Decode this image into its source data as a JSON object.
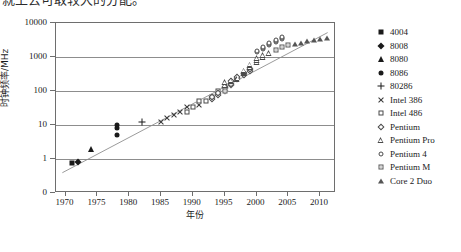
{
  "top_text": "就上去可取较大的分配。",
  "chart_data": {
    "type": "scatter",
    "title": "",
    "xlabel": "年份",
    "ylabel": "时钟频率/MHz",
    "xlim": [
      1968.5,
      2012.5
    ],
    "ylim_log": [
      0.1,
      10000
    ],
    "y_scale": "log",
    "grid": true,
    "legend_position": "right",
    "y_ticks": [
      {
        "label": "10000",
        "value": 10000
      },
      {
        "label": "1000",
        "value": 1000
      },
      {
        "label": "100",
        "value": 100
      },
      {
        "label": "10",
        "value": 10
      },
      {
        "label": "1",
        "value": 1
      },
      {
        "label": "0",
        "value": 0.1
      }
    ],
    "x_ticks": [
      {
        "label": "1970",
        "value": 1970
      },
      {
        "label": "1975",
        "value": 1975
      },
      {
        "label": "1980",
        "value": 1980
      },
      {
        "label": "1985",
        "value": 1985
      },
      {
        "label": "1990",
        "value": 1990
      },
      {
        "label": "1995",
        "value": 1995
      },
      {
        "label": "2000",
        "value": 2000
      },
      {
        "label": "2005",
        "value": 2005
      },
      {
        "label": "2010",
        "value": 2010
      }
    ],
    "trend_line": {
      "x0": 1969.5,
      "y0": 0.35,
      "x1": 2011.5,
      "y1": 5200
    },
    "series": [
      {
        "name": "4004",
        "marker": "filled-square",
        "marker_class": "m-sq-f",
        "points": [
          [
            1971,
            0.74
          ]
        ]
      },
      {
        "name": "8008",
        "marker": "filled-diamond",
        "marker_class": "m-di-f",
        "points": [
          [
            1972,
            0.8
          ]
        ]
      },
      {
        "name": "8080",
        "marker": "filled-triangle",
        "marker_class": "m-tr-f",
        "points": [
          [
            1974,
            2.0
          ]
        ]
      },
      {
        "name": "8086",
        "marker": "filled-circle",
        "marker_class": "m-ci-f",
        "points": [
          [
            1978,
            10.0
          ],
          [
            1978,
            8.0
          ],
          [
            1978,
            5.0
          ]
        ]
      },
      {
        "name": "80286",
        "marker": "plus",
        "marker_class": "m-plus",
        "points": [
          [
            1982,
            12.5
          ]
        ]
      },
      {
        "name": "Intel 386",
        "marker": "cross",
        "marker_class": "m-cross",
        "points": [
          [
            1985,
            12.0
          ],
          [
            1986,
            16.0
          ],
          [
            1987,
            20.0
          ],
          [
            1988,
            25.0
          ],
          [
            1989,
            33.0
          ],
          [
            1991,
            40.0
          ]
        ]
      },
      {
        "name": "Intel 486",
        "marker": "open-square",
        "marker_class": "m-sq-o",
        "points": [
          [
            1989,
            25.0
          ],
          [
            1990,
            33.0
          ],
          [
            1991,
            50.0
          ],
          [
            1992,
            50.0
          ],
          [
            1993,
            66.0
          ],
          [
            1994,
            100.0
          ]
        ]
      },
      {
        "name": "Pentium",
        "marker": "open-diamond",
        "marker_class": "m-di-o",
        "points": [
          [
            1993,
            60.0
          ],
          [
            1993,
            66.0
          ],
          [
            1994,
            75.0
          ],
          [
            1994,
            90.0
          ],
          [
            1995,
            100.0
          ],
          [
            1995,
            120.0
          ],
          [
            1995,
            133.0
          ],
          [
            1996,
            150.0
          ],
          [
            1996,
            166.0
          ],
          [
            1996,
            200.0
          ],
          [
            1997,
            233.0
          ],
          [
            1997,
            266.0
          ],
          [
            1998,
            300.0
          ],
          [
            1998,
            333.0
          ],
          [
            1999,
            400.0
          ],
          [
            1999,
            450.0
          ]
        ]
      },
      {
        "name": "Pentium Pro",
        "marker": "open-triangle",
        "marker_class": "m-tr-o",
        "points": [
          [
            1995,
            150.0
          ],
          [
            1995,
            180.0
          ],
          [
            1996,
            200.0
          ],
          [
            1997,
            233.0
          ],
          [
            1998,
            350.0
          ],
          [
            1998,
            400.0
          ],
          [
            1999,
            500.0
          ],
          [
            1999,
            600.0
          ],
          [
            2000,
            700.0
          ],
          [
            2000,
            800.0
          ],
          [
            2000,
            933.0
          ],
          [
            2001,
            1000.0
          ],
          [
            2001,
            1130.0
          ],
          [
            2002,
            1300.0
          ]
        ]
      },
      {
        "name": "Pentium 4",
        "marker": "open-circle",
        "marker_class": "m-ci-o",
        "points": [
          [
            2000,
            1400.0
          ],
          [
            2000,
            1500.0
          ],
          [
            2001,
            1700.0
          ],
          [
            2001,
            1900.0
          ],
          [
            2001,
            2000.0
          ],
          [
            2002,
            2200.0
          ],
          [
            2002,
            2400.0
          ],
          [
            2002,
            2530.0
          ],
          [
            2003,
            2800.0
          ],
          [
            2003,
            3000.0
          ],
          [
            2003,
            3200.0
          ],
          [
            2004,
            3400.0
          ],
          [
            2004,
            3600.0
          ],
          [
            2004,
            3800.0
          ]
        ]
      },
      {
        "name": "Pentium M",
        "marker": "small-open-square",
        "marker_class": "m-sqs-o",
        "points": [
          [
            1995,
            100.0
          ],
          [
            2003,
            1600.0
          ],
          [
            2004,
            2000.0
          ],
          [
            2005,
            2260.0
          ]
        ]
      },
      {
        "name": "Core 2 Duo",
        "marker": "small-filled-triangle",
        "marker_class": "m-tr-fs",
        "points": [
          [
            2006,
            2400.0
          ],
          [
            2007,
            2660.0
          ],
          [
            2008,
            3000.0
          ],
          [
            2009,
            3200.0
          ],
          [
            2010,
            3330.0
          ],
          [
            2011,
            3600.0
          ]
        ]
      }
    ]
  }
}
